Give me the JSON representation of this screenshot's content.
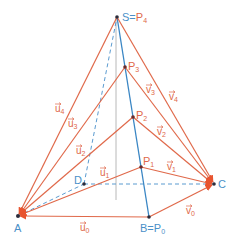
{
  "diagram": {
    "title": "",
    "colors": {
      "red": "#e0694a",
      "blue": "#3a86c4",
      "blue_dashed": "#5b9bd0",
      "gray": "#b0b0b0",
      "point": "#2b2b3a",
      "label_blue": "#4a90c8",
      "label_red": "#e0694a"
    },
    "points": {
      "A": {
        "label": "A",
        "x": 18,
        "y": 216
      },
      "B": {
        "label": "B",
        "eq": "=",
        "alias": "P",
        "alias_sub": "0",
        "x": 149,
        "y": 217
      },
      "C": {
        "label": "C",
        "x": 214,
        "y": 184
      },
      "D": {
        "label": "D",
        "x": 84,
        "y": 184
      },
      "S": {
        "label": "S",
        "eq": "=",
        "alias": "P",
        "alias_sub": "4",
        "x": 117,
        "y": 17
      },
      "P1": {
        "label": "P",
        "sub": "1",
        "x": 141,
        "y": 167
      },
      "P2": {
        "label": "P",
        "sub": "2",
        "x": 133,
        "y": 117
      },
      "P3": {
        "label": "P",
        "sub": "3",
        "x": 125,
        "y": 67
      }
    },
    "vectors_u": [
      {
        "name": "u",
        "sub": "0",
        "from": "A",
        "to": "B",
        "label_x": 80,
        "label_y": 231
      },
      {
        "name": "u",
        "sub": "1",
        "from": "A",
        "to": "P1",
        "label_x": 100,
        "label_y": 176
      },
      {
        "name": "u",
        "sub": "2",
        "from": "A",
        "to": "P2",
        "label_x": 76,
        "label_y": 154
      },
      {
        "name": "u",
        "sub": "3",
        "from": "A",
        "to": "P3",
        "label_x": 68,
        "label_y": 127
      },
      {
        "name": "u",
        "sub": "4",
        "from": "A",
        "to": "S",
        "label_x": 55,
        "label_y": 112
      }
    ],
    "vectors_v": [
      {
        "name": "v",
        "sub": "0",
        "from": "B",
        "to": "C",
        "label_x": 186,
        "label_y": 214
      },
      {
        "name": "v",
        "sub": "1",
        "from": "P1",
        "to": "C",
        "label_x": 167,
        "label_y": 170
      },
      {
        "name": "v",
        "sub": "2",
        "from": "P2",
        "to": "C",
        "label_x": 157,
        "label_y": 135
      },
      {
        "name": "v",
        "sub": "3",
        "from": "P3",
        "to": "C",
        "label_x": 146,
        "label_y": 93
      },
      {
        "name": "v",
        "sub": "4",
        "from": "S",
        "to": "C",
        "label_x": 169,
        "label_y": 100
      }
    ],
    "edges_blue_solid": [
      [
        "S",
        "B"
      ]
    ],
    "edges_blue_dashed": [
      [
        "A",
        "D"
      ],
      [
        "D",
        "C"
      ],
      [
        "D",
        "S"
      ]
    ],
    "height_line": {
      "x": 116,
      "y1": 17,
      "y2": 200
    }
  }
}
